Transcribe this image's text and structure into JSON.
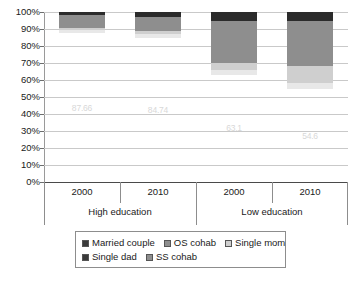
{
  "chart_data": {
    "type": "bar",
    "subtype": "stacked-100-percent",
    "title": "",
    "xlabel": "",
    "ylabel": "",
    "ylim": [
      0,
      100
    ],
    "grid": true,
    "legend_position": "bottom",
    "categories": [
      "2000",
      "2010",
      "2000",
      "2010"
    ],
    "groups": [
      {
        "label": "High education",
        "categories": [
          "2000",
          "2010"
        ]
      },
      {
        "label": "Low education",
        "categories": [
          "2000",
          "2010"
        ]
      }
    ],
    "ytick_labels": [
      "100%",
      "90%",
      "80%",
      "70%",
      "60%",
      "50%",
      "40%",
      "30%",
      "20%",
      "10%",
      "0%"
    ],
    "ytick_values": [
      100,
      90,
      80,
      70,
      60,
      50,
      40,
      30,
      20,
      10,
      0
    ],
    "series": [
      {
        "name": "Married couple",
        "color": "#3a3a3a",
        "values": [
          87.66,
          84.74,
          63.1,
          54.6
        ]
      },
      {
        "name": "Single dad",
        "color": "#e8e8e8",
        "values": [
          1.6,
          2.3,
          3.0,
          3.4
        ]
      },
      {
        "name": "Single mom",
        "color": "#cfcfcf",
        "values": [
          1.4,
          1.6,
          4.0,
          10.0
        ]
      },
      {
        "name": "OS cohab",
        "color": "#8e8e8e",
        "values": [
          7.3,
          8.4,
          24.9,
          27.0
        ]
      },
      {
        "name": "SS cohab",
        "color": "#2b2b2b",
        "values": [
          2.0,
          3.0,
          5.0,
          5.0
        ]
      }
    ],
    "bar_labels": [
      "87.66",
      "84.74",
      "63.1",
      "54.6"
    ],
    "legend_entries": [
      {
        "label": "Married couple",
        "color": "#3a3a3a"
      },
      {
        "label": "OS cohab",
        "color": "#8e8e8e"
      },
      {
        "label": "Single mom",
        "color": "#cfcfcf"
      },
      {
        "label": "Single dad",
        "color": "#3a3a3a"
      },
      {
        "label": "SS cohab",
        "color": "#8e8e8e"
      }
    ]
  }
}
